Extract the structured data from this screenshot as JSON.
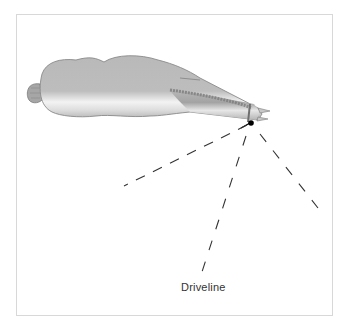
{
  "figure": {
    "type": "top-view livestock movement diagram",
    "colors": {
      "frame_border": "#d8d8d8",
      "body_fill": "#b7b7b7",
      "body_highlight": "#f2f2f2",
      "body_outline": "#8a8a8a",
      "dash_line": "#333333",
      "point_of_balance": "#000000",
      "label_text": "#333333"
    },
    "lines": [
      {
        "name": "left-dashed-line",
        "from": [
          247,
          125
        ],
        "to": [
          124,
          186
        ]
      },
      {
        "name": "driveline-dashed-line",
        "from": [
          246,
          136
        ],
        "to": [
          200,
          278
        ]
      },
      {
        "name": "right-dashed-line",
        "from": [
          260,
          134
        ],
        "to": [
          318,
          208
        ]
      }
    ],
    "labels": {
      "driveline": "Driveline"
    }
  }
}
